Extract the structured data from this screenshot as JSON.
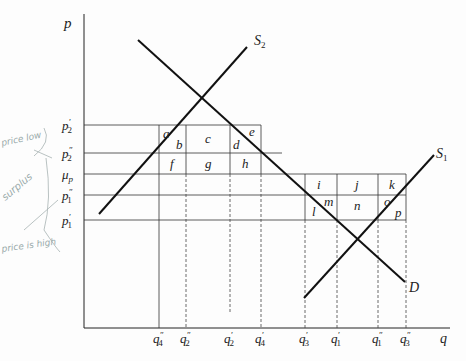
{
  "axes": {
    "y_label": "p",
    "x_label": "q"
  },
  "price_levels": [
    {
      "id": "p2_prime",
      "label": "p",
      "sub": "2",
      "mark": "′",
      "y": 125
    },
    {
      "id": "p2_dprime",
      "label": "p",
      "sub": "2",
      "mark": "″",
      "y": 153
    },
    {
      "id": "mu_p",
      "label": "μ",
      "sub": "p",
      "mark": "",
      "y": 174
    },
    {
      "id": "p1_dprime",
      "label": "p",
      "sub": "1",
      "mark": "″",
      "y": 195
    },
    {
      "id": "p1_prime",
      "label": "p",
      "sub": "1",
      "mark": "′",
      "y": 220
    }
  ],
  "quantity_levels": [
    {
      "id": "q4_dprime",
      "label": "q",
      "sub": "4",
      "mark": "″",
      "x": 159
    },
    {
      "id": "q2_dprime",
      "label": "q",
      "sub": "2",
      "mark": "″",
      "x": 186
    },
    {
      "id": "q2_prime",
      "label": "q",
      "sub": "2",
      "mark": "′",
      "x": 230
    },
    {
      "id": "q4_prime",
      "label": "q",
      "sub": "4",
      "mark": "′",
      "x": 261
    },
    {
      "id": "q3_prime",
      "label": "q",
      "sub": "3",
      "mark": "′",
      "x": 305
    },
    {
      "id": "q1_prime",
      "label": "q",
      "sub": "1",
      "mark": "′",
      "x": 337
    },
    {
      "id": "q1_dprime",
      "label": "q",
      "sub": "1",
      "mark": "″",
      "x": 378
    },
    {
      "id": "q3_dprime",
      "label": "q",
      "sub": "3",
      "mark": "″",
      "x": 406
    }
  ],
  "curves": {
    "S2": {
      "label": "S",
      "sub": "2"
    },
    "S1": {
      "label": "S",
      "sub": "1"
    },
    "D": {
      "label": "D"
    }
  },
  "area_labels": [
    "a",
    "b",
    "c",
    "d",
    "e",
    "f",
    "g",
    "h",
    "i",
    "j",
    "k",
    "l",
    "m",
    "n",
    "o",
    "p"
  ],
  "annotations": {
    "top": "price low",
    "middle": "surplus",
    "bottom": "price is high"
  }
}
